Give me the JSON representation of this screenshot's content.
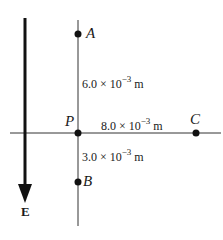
{
  "diagram": {
    "points": {
      "A": {
        "label": "A"
      },
      "P": {
        "label": "P"
      },
      "B": {
        "label": "B"
      },
      "C": {
        "label": "C"
      }
    },
    "distances": {
      "PA": {
        "mantissa": "6.0 × 10",
        "exponent": "−3",
        "unit": " m"
      },
      "PC": {
        "mantissa": "8.0 × 10",
        "exponent": "−3",
        "unit": " m"
      },
      "PB": {
        "mantissa": "3.0 × 10",
        "exponent": "−3",
        "unit": " m"
      }
    },
    "field": {
      "label": "E",
      "direction": "down"
    },
    "colors": {
      "ink": "#1a1a1a",
      "background": "#ffffff"
    }
  }
}
